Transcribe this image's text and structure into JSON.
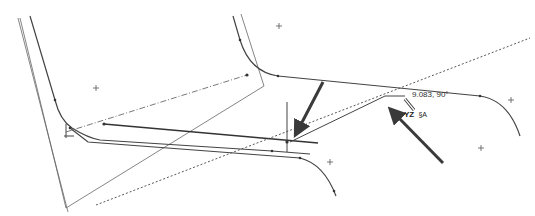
{
  "viewport": {
    "type": "cad-sketch-view",
    "background": "#ffffff",
    "line_color": "#444444",
    "arrow_color": "#3a3a3a"
  },
  "dimension": {
    "text": "9.083, 90°"
  },
  "plane": {
    "name": "YZ",
    "icon": "sketch-relation-icon",
    "icon_text": "§A"
  },
  "points": [
    {
      "name": "origin-point-1",
      "x": 96,
      "y": 88
    },
    {
      "name": "origin-point-2",
      "x": 279,
      "y": 26
    },
    {
      "name": "origin-point-3",
      "x": 511,
      "y": 100
    },
    {
      "name": "origin-point-4",
      "x": 481,
      "y": 148
    },
    {
      "name": "origin-point-5",
      "x": 330,
      "y": 162
    }
  ]
}
